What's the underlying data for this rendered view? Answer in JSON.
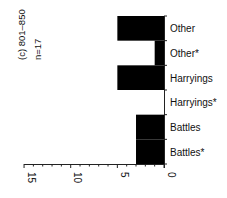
{
  "chart_data": {
    "type": "bar",
    "orientation": "horizontal-rotated",
    "title": "(c) 801–850",
    "subtitle": "n=17",
    "categories": [
      "Other",
      "Other*",
      "Harryings",
      "Harryings*",
      "Battles",
      "Battles*"
    ],
    "values": [
      5,
      1,
      5,
      0,
      3,
      3
    ],
    "xlabel": "",
    "ylabel": "",
    "axis_ticks": [
      "15",
      "10",
      "5",
      "0"
    ],
    "axis_range": [
      0,
      15
    ],
    "bar_color": "#000000",
    "grid": false,
    "legend": null
  }
}
